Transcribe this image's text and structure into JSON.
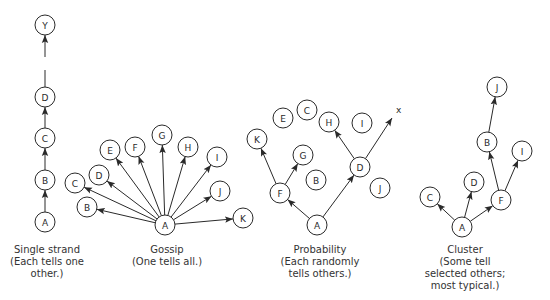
{
  "colors": {
    "stroke": "#2a2a2a",
    "background": "#ffffff",
    "text": "#333333"
  },
  "node_radius": 10,
  "panels": [
    {
      "id": "single-strand",
      "caption_lines": [
        "Single strand",
        "(Each tells one",
        "other.)"
      ],
      "caption_x": 47,
      "caption_y": 244,
      "nodes": [
        {
          "id": "Y",
          "x": 45,
          "y": 25
        },
        {
          "id": "D",
          "x": 45,
          "y": 97
        },
        {
          "id": "C",
          "x": 45,
          "y": 138
        },
        {
          "id": "B",
          "x": 45,
          "y": 180
        },
        {
          "id": "A",
          "x": 45,
          "y": 222
        }
      ],
      "edges": [
        {
          "from": "A",
          "to": "B",
          "arrow": true
        },
        {
          "from": "B",
          "to": "C",
          "arrow": true
        },
        {
          "from": "C",
          "to": "D",
          "arrow": true
        },
        {
          "from_point": [
            45,
            87
          ],
          "to_point": [
            45,
            70
          ],
          "arrow": false
        },
        {
          "from_point": [
            45,
            57
          ],
          "to": "Y",
          "arrow": true
        }
      ]
    },
    {
      "id": "gossip",
      "caption_lines": [
        "Gossip",
        "(One tells all.)"
      ],
      "caption_x": 167,
      "caption_y": 244,
      "nodes": [
        {
          "id": "A",
          "x": 165,
          "y": 225
        },
        {
          "id": "B",
          "x": 87,
          "y": 207
        },
        {
          "id": "C",
          "x": 75,
          "y": 183
        },
        {
          "id": "D",
          "x": 99,
          "y": 175
        },
        {
          "id": "E",
          "x": 110,
          "y": 150
        },
        {
          "id": "F",
          "x": 135,
          "y": 147
        },
        {
          "id": "G",
          "x": 162,
          "y": 135
        },
        {
          "id": "H",
          "x": 188,
          "y": 147
        },
        {
          "id": "I",
          "x": 217,
          "y": 157
        },
        {
          "id": "J",
          "x": 220,
          "y": 191
        },
        {
          "id": "K",
          "x": 243,
          "y": 218
        }
      ],
      "edges": [
        {
          "from": "A",
          "to": "B",
          "arrow": true
        },
        {
          "from": "A",
          "to": "C",
          "arrow": true
        },
        {
          "from": "A",
          "to": "D",
          "arrow": true
        },
        {
          "from": "A",
          "to": "E",
          "arrow": true
        },
        {
          "from": "A",
          "to": "F",
          "arrow": true
        },
        {
          "from": "A",
          "to": "G",
          "arrow": true
        },
        {
          "from": "A",
          "to": "H",
          "arrow": true
        },
        {
          "from": "A",
          "to": "I",
          "arrow": true
        },
        {
          "from": "A",
          "to": "J",
          "arrow": true
        },
        {
          "from": "A",
          "to": "K",
          "arrow": true
        }
      ]
    },
    {
      "id": "probability",
      "caption_lines": [
        "Probability",
        "(Each randomly",
        "tells others.)"
      ],
      "caption_x": 320,
      "caption_y": 244,
      "nodes": [
        {
          "id": "A",
          "x": 317,
          "y": 225
        },
        {
          "id": "F",
          "x": 280,
          "y": 193
        },
        {
          "id": "K",
          "x": 257,
          "y": 139
        },
        {
          "id": "G",
          "x": 303,
          "y": 155
        },
        {
          "id": "E",
          "x": 283,
          "y": 118
        },
        {
          "id": "C",
          "x": 307,
          "y": 110
        },
        {
          "id": "H",
          "x": 329,
          "y": 122
        },
        {
          "id": "I",
          "x": 362,
          "y": 123
        },
        {
          "id": "B",
          "x": 316,
          "y": 180
        },
        {
          "id": "D",
          "x": 360,
          "y": 167
        },
        {
          "id": "J",
          "x": 380,
          "y": 188
        }
      ],
      "x_marker": {
        "label": "x",
        "x": 396,
        "y": 113
      },
      "edges": [
        {
          "from": "A",
          "to": "F",
          "arrow": true
        },
        {
          "from": "A",
          "to": "D",
          "arrow": true
        },
        {
          "from": "F",
          "to": "K",
          "arrow": true
        },
        {
          "from": "F",
          "to": "G",
          "arrow": true
        },
        {
          "from": "D",
          "to": "H",
          "arrow": true
        },
        {
          "from": "D",
          "to_point": [
            392,
            118
          ],
          "arrow": true
        }
      ]
    },
    {
      "id": "cluster",
      "caption_lines": [
        "Cluster",
        "(Some tell",
        "selected others;",
        "most typical.)"
      ],
      "caption_x": 465,
      "caption_y": 244,
      "nodes": [
        {
          "id": "A",
          "x": 462,
          "y": 227
        },
        {
          "id": "C",
          "x": 430,
          "y": 197
        },
        {
          "id": "D",
          "x": 474,
          "y": 182
        },
        {
          "id": "F",
          "x": 501,
          "y": 200
        },
        {
          "id": "B",
          "x": 487,
          "y": 142
        },
        {
          "id": "J",
          "x": 497,
          "y": 87
        },
        {
          "id": "I",
          "x": 522,
          "y": 151
        }
      ],
      "edges": [
        {
          "from": "A",
          "to": "C",
          "arrow": true
        },
        {
          "from": "A",
          "to": "D",
          "arrow": true
        },
        {
          "from": "A",
          "to": "F",
          "arrow": true
        },
        {
          "from": "F",
          "to": "B",
          "arrow": true
        },
        {
          "from": "F",
          "to": "I",
          "arrow": true
        },
        {
          "from": "B",
          "to": "J",
          "arrow": true
        }
      ]
    }
  ]
}
